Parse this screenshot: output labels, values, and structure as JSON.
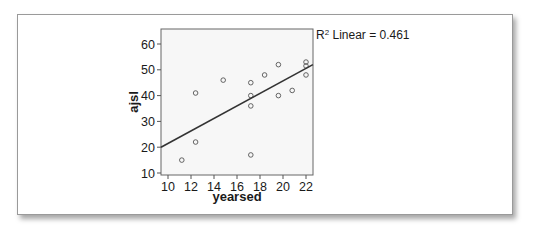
{
  "chart_data": {
    "type": "scatter",
    "title": "",
    "xlabel": "yearsed",
    "ylabel": "ajsl",
    "xlim": [
      9.3,
      22.6
    ],
    "ylim": [
      10,
      65
    ],
    "x_ticks": [
      10,
      12,
      14,
      16,
      18,
      20,
      22
    ],
    "y_ticks": [
      10,
      20,
      30,
      40,
      50,
      60
    ],
    "grid": false,
    "legend": null,
    "annotation": "R² Linear = 0.461",
    "series": [
      {
        "name": "observations",
        "points": [
          {
            "x": 11.2,
            "y": 15
          },
          {
            "x": 12.4,
            "y": 22
          },
          {
            "x": 12.4,
            "y": 41
          },
          {
            "x": 14.8,
            "y": 46
          },
          {
            "x": 17.2,
            "y": 45
          },
          {
            "x": 17.2,
            "y": 40
          },
          {
            "x": 17.2,
            "y": 36
          },
          {
            "x": 17.2,
            "y": 17
          },
          {
            "x": 18.4,
            "y": 48
          },
          {
            "x": 19.6,
            "y": 52
          },
          {
            "x": 19.6,
            "y": 40
          },
          {
            "x": 20.8,
            "y": 42
          },
          {
            "x": 22,
            "y": 53
          },
          {
            "x": 22,
            "y": 51.5
          },
          {
            "x": 22,
            "y": 48
          }
        ]
      }
    ],
    "fit_line": {
      "type": "linear",
      "r_squared": 0.461,
      "start": {
        "x": 9.3,
        "y": 20
      },
      "end": {
        "x": 22.6,
        "y": 52
      }
    }
  },
  "labels": {
    "x_axis_title": "yearsed",
    "y_axis_title": "ajsl",
    "r2_prefix": "R",
    "r2_sup": "2",
    "r2_text": " Linear = 0.461"
  },
  "colors": {
    "plot_background": "#f7f7f7",
    "axis": "#555555",
    "line": "#333333",
    "marker_stroke": "#555555"
  }
}
